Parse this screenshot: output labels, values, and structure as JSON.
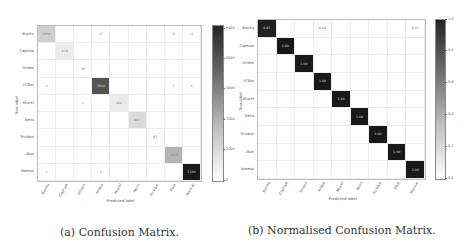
{
  "chart_data": [
    {
      "type": "heatmap",
      "title": "Confusion Matrix",
      "xlabel": "Predicted label",
      "ylabel": "True label",
      "categories": [
        "Bunitu",
        "Caphaw",
        "Dridex",
        "HTBot",
        "Miuref",
        "Neris",
        "Trickbot",
        "Zbot",
        "Normal"
      ],
      "values": [
        [
          1050,
          0,
          0,
          17,
          0,
          0,
          0,
          8,
          11
        ],
        [
          0,
          419,
          0,
          0,
          0,
          0,
          0,
          0,
          0
        ],
        [
          0,
          0,
          39,
          0,
          0,
          0,
          0,
          0,
          0
        ],
        [
          6,
          0,
          0,
          3800,
          0,
          0,
          0,
          3,
          4
        ],
        [
          0,
          0,
          1,
          0,
          460,
          0,
          0,
          0,
          0
        ],
        [
          0,
          0,
          0,
          0,
          0,
          807,
          0,
          0,
          0
        ],
        [
          0,
          0,
          0,
          0,
          0,
          0,
          83,
          0,
          0
        ],
        [
          0,
          0,
          0,
          0,
          0,
          0,
          0,
          1667,
          0
        ],
        [
          1,
          0,
          0,
          4,
          0,
          0,
          0,
          0,
          5100
        ]
      ],
      "colorbar": {
        "ticks": [
          "0",
          "1000",
          "2000",
          "3000",
          "4000",
          "5000"
        ],
        "range": [
          0,
          5100
        ]
      },
      "colormap": "Greys"
    },
    {
      "type": "heatmap",
      "title": "Normalised Confusion Matrix",
      "xlabel": "Predicted label",
      "ylabel": "True label",
      "categories": [
        "Bunitu",
        "Caphaw",
        "Dridex",
        "HTBot",
        "Miuref",
        "Neris",
        "Trickbot",
        "Zbot",
        "Normal"
      ],
      "values": [
        [
          0.97,
          0,
          0,
          0.02,
          0,
          0,
          0,
          0,
          0.01
        ],
        [
          0,
          1.0,
          0,
          0,
          0,
          0,
          0,
          0,
          0
        ],
        [
          0,
          0,
          1.0,
          0,
          0,
          0,
          0,
          0,
          0
        ],
        [
          0,
          0,
          0,
          1.0,
          0,
          0,
          0,
          0,
          0
        ],
        [
          0,
          0,
          0,
          0,
          1.0,
          0,
          0,
          0,
          0
        ],
        [
          0,
          0,
          0,
          0,
          0,
          1.0,
          0,
          0,
          0
        ],
        [
          0,
          0,
          0,
          0,
          0,
          0,
          1.0,
          0,
          0
        ],
        [
          0,
          0,
          0,
          0,
          0,
          0,
          0,
          1.0,
          0
        ],
        [
          0,
          0,
          0,
          0,
          0,
          0,
          0,
          0,
          1.0
        ]
      ],
      "colorbar": {
        "ticks": [
          "0.0",
          "0.2",
          "0.4",
          "0.6",
          "0.8",
          "1.0"
        ],
        "range": [
          0,
          1
        ]
      },
      "colormap": "Greys"
    }
  ],
  "captions": {
    "a": "(a) Confusion Matrix.",
    "b": "(b) Normalised Confusion Matrix."
  },
  "labels": {
    "xlabel": "Predicted label",
    "ylabel": "True label"
  }
}
